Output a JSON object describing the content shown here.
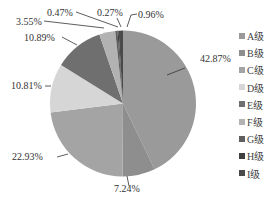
{
  "chart_data": {
    "type": "pie",
    "title": "",
    "start_angle_deg": 0,
    "direction": "clockwise",
    "categories": [
      "A级",
      "B级",
      "C级",
      "D级",
      "E级",
      "F级",
      "G级",
      "H级",
      "I级"
    ],
    "values": [
      42.87,
      7.24,
      22.93,
      10.81,
      10.89,
      3.55,
      0.47,
      0.27,
      0.96
    ],
    "value_labels": [
      "42.87%",
      "7.24%",
      "22.93%",
      "10.81%",
      "10.89%",
      "3.55%",
      "0.47%",
      "0.27%",
      "0.96%"
    ],
    "colors": [
      "#9a9a9a",
      "#8e8e8e",
      "#a4a4a4",
      "#d6d6d6",
      "#6f6f6f",
      "#b2b2b2",
      "#5e5e5e",
      "#3f3f3f",
      "#4a4a4a"
    ],
    "legend_position": "right"
  },
  "legend": {
    "items": [
      {
        "label": "A级",
        "color": "#9a9a9a"
      },
      {
        "label": "B级",
        "color": "#8e8e8e"
      },
      {
        "label": "C级",
        "color": "#a4a4a4"
      },
      {
        "label": "D级",
        "color": "#d6d6d6"
      },
      {
        "label": "E级",
        "color": "#6f6f6f"
      },
      {
        "label": "F级",
        "color": "#b2b2b2"
      },
      {
        "label": "G级",
        "color": "#5e5e5e"
      },
      {
        "label": "H级",
        "color": "#3f3f3f"
      },
      {
        "label": "I级",
        "color": "#4a4a4a"
      }
    ]
  }
}
